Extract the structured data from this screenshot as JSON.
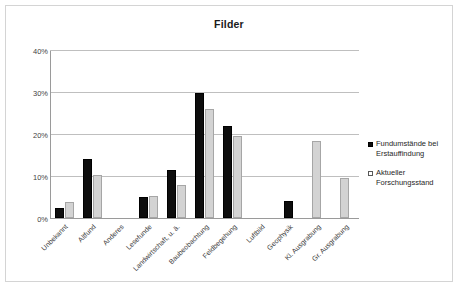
{
  "chart_data": {
    "type": "bar",
    "title": "Filder",
    "xlabel": "",
    "ylabel": "",
    "ylim": [
      0,
      40
    ],
    "yticks": [
      0,
      10,
      20,
      30,
      40
    ],
    "ytick_labels": [
      "0%",
      "10%",
      "20%",
      "30%",
      "40%"
    ],
    "grid": true,
    "legend_position": "right",
    "value_suffix": "%",
    "categories": [
      "Unbekannt",
      "Altfund",
      "Anderes",
      "Lesefunde",
      "Landwirtschaft, u. ä.",
      "Baubeobachtung",
      "Feldbegehung",
      "Luftbild",
      "Geophysik",
      "Kl. Ausgrabung",
      "Gr. Ausgrabung"
    ],
    "series": [
      {
        "name": "Fundumstände bei Erstauffindung",
        "color": "#0d0d0d",
        "values": [
          2.4,
          14.2,
          0,
          5.1,
          11.6,
          30.0,
          22.0,
          0,
          4.0,
          0,
          0
        ]
      },
      {
        "name": "Aktueller Forschungsstand",
        "color": "#d3d3d3",
        "values": [
          3.9,
          10.4,
          0,
          5.3,
          7.9,
          26.0,
          19.7,
          0,
          0,
          18.5,
          9.5
        ]
      }
    ]
  },
  "legend": {
    "items": [
      {
        "label_line1": "Fundumstände bei",
        "label_line2": "Erstauffindung"
      },
      {
        "label_line1": "Aktueller",
        "label_line2": "Forschungsstand"
      }
    ]
  }
}
